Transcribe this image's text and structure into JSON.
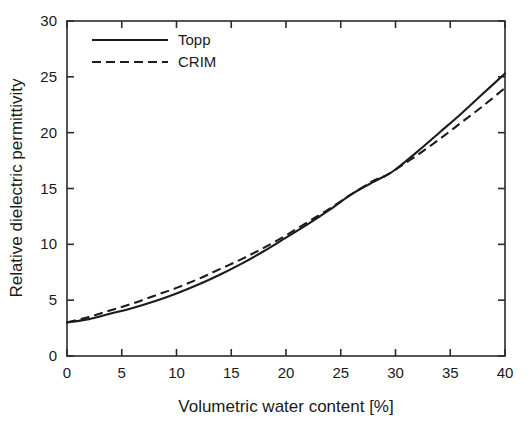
{
  "chart_data": {
    "type": "line",
    "title": "",
    "xlabel": "Volumetric water content [%]",
    "ylabel": "Relative dielectric permittivity",
    "xlim": [
      0,
      40
    ],
    "ylim": [
      0,
      30
    ],
    "xticks": [
      0,
      5,
      10,
      15,
      20,
      25,
      30,
      35,
      40
    ],
    "yticks": [
      0,
      5,
      10,
      15,
      20,
      25,
      30
    ],
    "xtick_labels": [
      "0",
      "5",
      "10",
      "15",
      "20",
      "25",
      "30",
      "35",
      "40"
    ],
    "ytick_labels": [
      "0",
      "5",
      "10",
      "15",
      "20",
      "25",
      "30"
    ],
    "grid": false,
    "legend_position": "upper-left-inside",
    "legend_frame": false,
    "x": [
      0,
      2,
      4,
      6,
      8,
      10,
      12,
      14,
      16,
      18,
      20,
      22,
      24,
      26,
      28,
      29,
      30,
      32,
      34,
      36,
      38,
      40
    ],
    "series": [
      {
        "name": "Topp",
        "style": "solid",
        "color": "#1c1c1c",
        "values": [
          3.0,
          3.3,
          3.8,
          4.3,
          4.9,
          5.6,
          6.4,
          7.3,
          8.3,
          9.4,
          10.6,
          11.8,
          13.1,
          14.5,
          15.6,
          16.1,
          16.7,
          18.3,
          20.0,
          21.7,
          23.5,
          25.3
        ]
      },
      {
        "name": "CRIM",
        "style": "dashed",
        "color": "#1c1c1c",
        "values": [
          3.0,
          3.5,
          4.1,
          4.7,
          5.4,
          6.1,
          6.9,
          7.8,
          8.7,
          9.7,
          10.8,
          12.0,
          13.2,
          14.5,
          15.7,
          16.1,
          16.7,
          18.0,
          19.4,
          20.9,
          22.4,
          24.0
        ]
      }
    ]
  },
  "legend": {
    "entries": [
      {
        "label": "Topp"
      },
      {
        "label": "CRIM"
      }
    ]
  }
}
